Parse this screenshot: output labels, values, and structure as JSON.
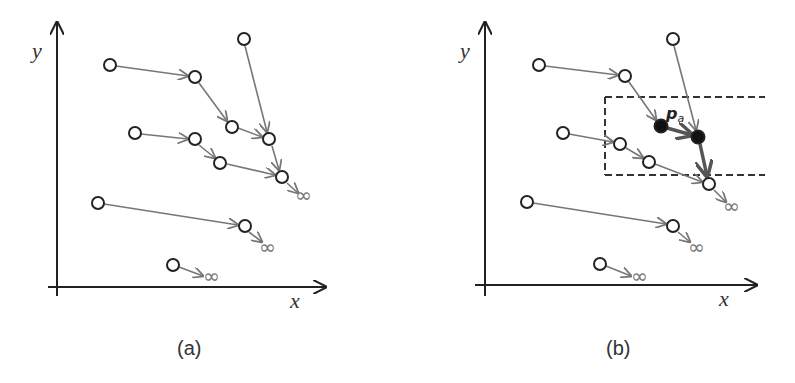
{
  "figure": {
    "panels": [
      {
        "id": "a",
        "caption": "(a)",
        "axis_labels": {
          "x": "x",
          "y": "y"
        },
        "infinity_symbol": "∞"
      },
      {
        "id": "b",
        "caption": "(b)",
        "axis_labels": {
          "x": "x",
          "y": "y"
        },
        "infinity_symbol": "∞",
        "highlight_label": "p",
        "highlight_subscript": "a"
      }
    ],
    "colors": {
      "axis": "#222222",
      "edge": "#777777",
      "highlight_edge": "#555555",
      "node_stroke": "#222222",
      "node_fill_open": "#ffffff",
      "node_fill_filled": "#111111",
      "dashed_box": "#333333"
    }
  }
}
